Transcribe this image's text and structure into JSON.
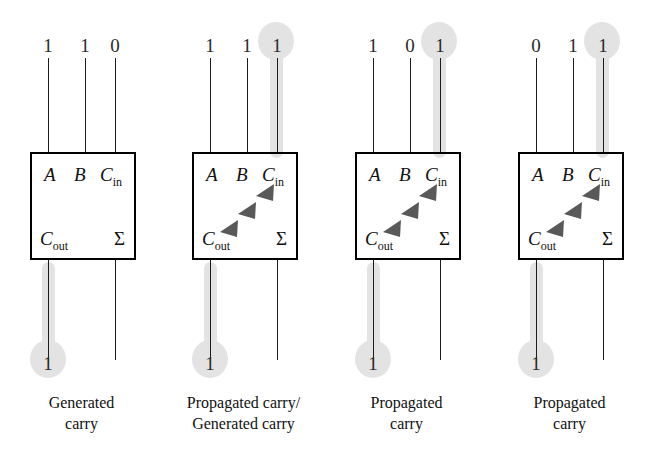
{
  "figure": {
    "highlight_color": "#e3e3e3",
    "line_color": "#1c1c1c",
    "box_border_color": "#000000"
  },
  "ports": {
    "a": "A",
    "b": "B",
    "cin_main": "C",
    "cin_sub": "in",
    "cout_main": "C",
    "cout_sub": "out",
    "sum": "Σ"
  },
  "blocks": [
    {
      "id": "adder-1",
      "inputs": {
        "a": "1",
        "b": "1",
        "cin": "0"
      },
      "outputs": {
        "cout": "1",
        "sum": ""
      },
      "cin_highlighted": false,
      "cout_highlighted": true,
      "show_arrows": false,
      "caption_line1": "Generated",
      "caption_line2": "carry"
    },
    {
      "id": "adder-2",
      "inputs": {
        "a": "1",
        "b": "1",
        "cin": "1"
      },
      "outputs": {
        "cout": "1",
        "sum": ""
      },
      "cin_highlighted": true,
      "cout_highlighted": true,
      "show_arrows": true,
      "caption_line1": "Propagated carry/",
      "caption_line2": "Generated carry"
    },
    {
      "id": "adder-3",
      "inputs": {
        "a": "1",
        "b": "0",
        "cin": "1"
      },
      "outputs": {
        "cout": "1",
        "sum": ""
      },
      "cin_highlighted": true,
      "cout_highlighted": true,
      "show_arrows": true,
      "caption_line1": "Propagated",
      "caption_line2": "carry"
    },
    {
      "id": "adder-4",
      "inputs": {
        "a": "0",
        "b": "1",
        "cin": "1"
      },
      "outputs": {
        "cout": "1",
        "sum": ""
      },
      "cin_highlighted": true,
      "cout_highlighted": true,
      "show_arrows": true,
      "caption_line1": "Propagated",
      "caption_line2": "carry"
    }
  ]
}
